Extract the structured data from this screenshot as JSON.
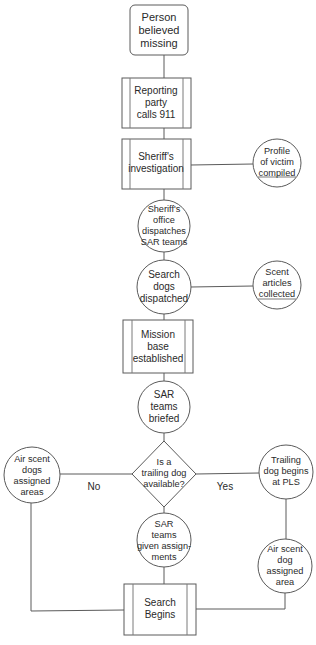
{
  "diagram": {
    "type": "flowchart",
    "nodes": {
      "start": {
        "shape": "rounded-rect",
        "lines": [
          "Person",
          "believed",
          "missing"
        ]
      },
      "report": {
        "shape": "process",
        "lines": [
          "Reporting",
          "party",
          "calls 911"
        ]
      },
      "investigation": {
        "shape": "process",
        "lines": [
          "Sheriff's",
          "investigation"
        ]
      },
      "profile": {
        "shape": "circle",
        "lines": [
          "Profile",
          "of victim",
          "compiled"
        ]
      },
      "dispatch_sar": {
        "shape": "circle",
        "lines": [
          "Sheriff's",
          "office",
          "dispatches",
          "SAR teams"
        ]
      },
      "dogs_dispatched": {
        "shape": "circle",
        "lines": [
          "Search",
          "dogs",
          "dispatched"
        ]
      },
      "scent_articles": {
        "shape": "circle",
        "lines": [
          "Scent",
          "articles",
          "collected"
        ]
      },
      "mission_base": {
        "shape": "process",
        "lines": [
          "Mission",
          "base",
          "established"
        ]
      },
      "briefed": {
        "shape": "circle",
        "lines": [
          "SAR",
          "teams",
          "briefed"
        ]
      },
      "decision": {
        "shape": "diamond",
        "lines": [
          "Is a",
          "trailing dog",
          "available?"
        ]
      },
      "air_scent_areas": {
        "shape": "circle",
        "lines": [
          "Air scent",
          "dogs",
          "assigned",
          "areas"
        ]
      },
      "trailing_pls": {
        "shape": "circle",
        "lines": [
          "Trailing",
          "dog begins",
          "at PLS"
        ]
      },
      "assignments": {
        "shape": "circle",
        "lines": [
          "SAR",
          "teams",
          "given assign-",
          "ments"
        ]
      },
      "air_scent_area": {
        "shape": "circle",
        "lines": [
          "Air scent",
          "dog",
          "assigned",
          "area"
        ]
      },
      "search_begins": {
        "shape": "process",
        "lines": [
          "Search",
          "Begins"
        ]
      }
    },
    "edge_labels": {
      "no": "No",
      "yes": "Yes"
    },
    "edges": [
      [
        "start",
        "report"
      ],
      [
        "report",
        "investigation"
      ],
      [
        "investigation",
        "profile"
      ],
      [
        "investigation",
        "dispatch_sar"
      ],
      [
        "dispatch_sar",
        "dogs_dispatched"
      ],
      [
        "dogs_dispatched",
        "scent_articles"
      ],
      [
        "dogs_dispatched",
        "mission_base"
      ],
      [
        "mission_base",
        "briefed"
      ],
      [
        "briefed",
        "decision"
      ],
      [
        "decision",
        "air_scent_areas",
        "No"
      ],
      [
        "decision",
        "trailing_pls",
        "Yes"
      ],
      [
        "decision",
        "assignments"
      ],
      [
        "trailing_pls",
        "air_scent_area"
      ],
      [
        "air_scent_areas",
        "search_begins"
      ],
      [
        "assignments",
        "search_begins"
      ],
      [
        "air_scent_area",
        "search_begins"
      ]
    ]
  }
}
